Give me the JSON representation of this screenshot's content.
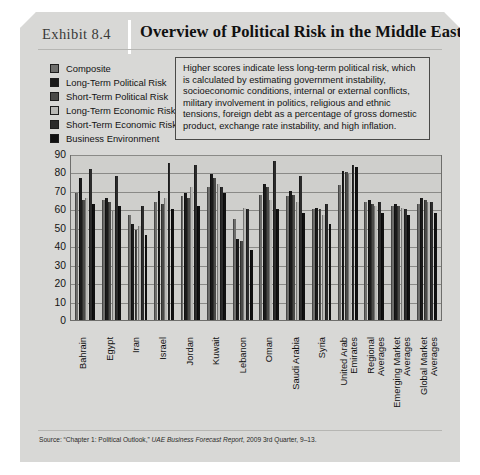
{
  "exhibit": {
    "label": "Exhibit 8.4",
    "title": "Overview of Political Risk in the Middle East",
    "source_prefix": "Source: “Chapter 1: Political Outlook,” ",
    "source_italic": "UAE Business Forecast Report",
    "source_suffix": ", 2009 3rd Quarter, 9–13."
  },
  "callout": {
    "text": "Higher scores indicate less long-term political risk, which is calculated by estimating government instability, socioeconomic conditions, internal or external conflicts, military involvement in politics, religious and ethnic tensions, foreign debt as a percentage of gross domestic product, exchange rate instability, and high inflation."
  },
  "legend": {
    "items": [
      {
        "label": "Composite",
        "color": "#6e6e6c"
      },
      {
        "label": "Long-Term Political Risk",
        "color": "#1a1a1a"
      },
      {
        "label": "Short-Term Political Risk",
        "color": "#4a4a48"
      },
      {
        "label": "Long-Term Economic Risk",
        "color": "#b9b9b6"
      },
      {
        "label": "Short-Term Economic Risk",
        "color": "#2b2b2b"
      },
      {
        "label": "Business Environment",
        "color": "#111111"
      }
    ]
  },
  "chart_data": {
    "type": "bar",
    "title": "Overview of Political Risk in the Middle East",
    "xlabel": "",
    "ylabel": "",
    "ylim": [
      0,
      90
    ],
    "yticks": [
      0,
      10,
      20,
      30,
      40,
      50,
      60,
      70,
      80,
      90
    ],
    "grid": true,
    "legend_position": "top-left",
    "categories": [
      "Bahrain",
      "Egypt",
      "Iran",
      "Israel",
      "Jordan",
      "Kuwait",
      "Lebanon",
      "Oman",
      "Saudi Arabia",
      "Syria",
      "United Arab Emirates",
      "Regional Averages",
      "Emerging Market Averages",
      "Global Market Averages"
    ],
    "series": [
      {
        "name": "Composite",
        "color": "#6e6e6c",
        "values": [
          69,
          65,
          57,
          64,
          67,
          72,
          55,
          68,
          67,
          60,
          73,
          64,
          62,
          63
        ]
      },
      {
        "name": "Long-Term Political Risk",
        "color": "#1a1a1a",
        "values": [
          77,
          66,
          52,
          70,
          69,
          79,
          44,
          74,
          70,
          61,
          81,
          65,
          63,
          66
        ]
      },
      {
        "name": "Short-Term Political Risk",
        "color": "#4a4a48",
        "values": [
          65,
          64,
          49,
          63,
          66,
          77,
          43,
          72,
          68,
          60,
          80,
          63,
          62,
          65
        ]
      },
      {
        "name": "Long-Term Economic Risk",
        "color": "#b9b9b6",
        "values": [
          66,
          59,
          51,
          66,
          72,
          74,
          61,
          65,
          64,
          57,
          79,
          62,
          61,
          64
        ]
      },
      {
        "name": "Short-Term Economic Risk",
        "color": "#2b2b2b",
        "values": [
          82,
          78,
          62,
          85,
          84,
          72,
          60,
          86,
          78,
          63,
          84,
          64,
          60,
          64
        ]
      },
      {
        "name": "Business Environment",
        "color": "#111111",
        "values": [
          63,
          62,
          46,
          60,
          62,
          69,
          38,
          60,
          58,
          52,
          83,
          58,
          57,
          58
        ]
      }
    ],
    "annotation": "Higher scores indicate less long-term political risk, which is calculated by estimating government instability, socioeconomic conditions, internal or external conflicts, military involvement in politics, religious and ethnic tensions, foreign debt as a percentage of gross domestic product, exchange rate instability, and high inflation."
  }
}
